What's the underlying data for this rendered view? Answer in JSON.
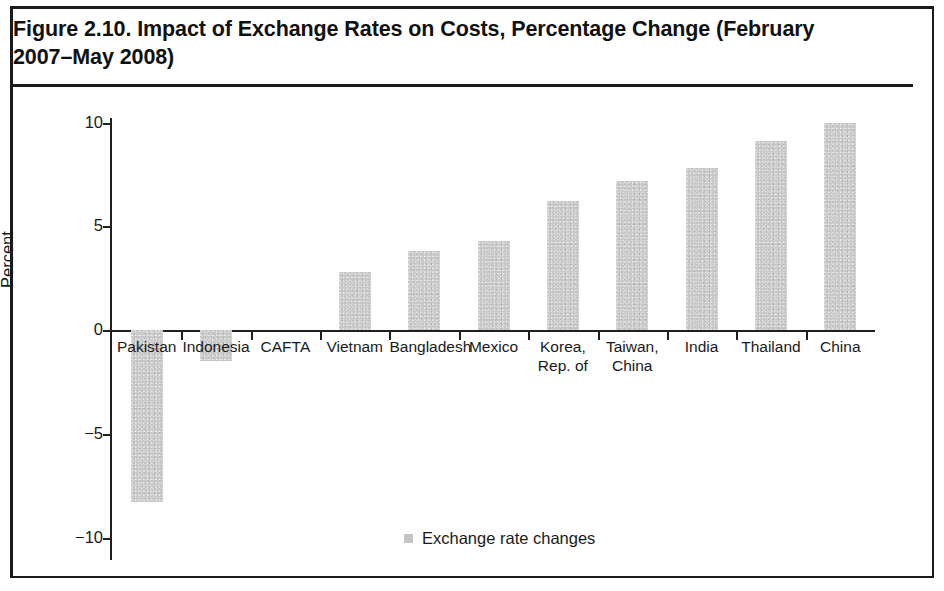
{
  "figure": {
    "title": "Figure 2.10. Impact of Exchange Rates on Costs, Percentage Change (February 2007–May 2008)"
  },
  "legend": {
    "label": "Exchange rate changes",
    "swatch_color": "#c4c4c4"
  },
  "axes": {
    "ylabel": "Percent",
    "yticks": [
      "10",
      "5",
      "0",
      "−5",
      "−10"
    ]
  },
  "chart_data": {
    "type": "bar",
    "title": "Figure 2.10. Impact of Exchange Rates on Costs, Percentage Change (February 2007–May 2008)",
    "xlabel": "",
    "ylabel": "Percent",
    "ylim": [
      -10,
      10
    ],
    "ytick_values": [
      10,
      5,
      0,
      -5,
      -10
    ],
    "grid": false,
    "legend_position": "bottom-center",
    "bar_color": "#c9c9c9",
    "categories": [
      "Pakistan",
      "Indonesia",
      "CAFTA",
      "Vietnam",
      "Bangladesh",
      "Mexico",
      "Korea,\nRep. of",
      "Taiwan,\nChina",
      "India",
      "Thailand",
      "China"
    ],
    "series": [
      {
        "name": "Exchange rate changes",
        "values": [
          -8.3,
          -1.5,
          0.0,
          2.8,
          3.8,
          4.3,
          6.2,
          7.2,
          7.8,
          9.1,
          10.0
        ]
      }
    ]
  }
}
